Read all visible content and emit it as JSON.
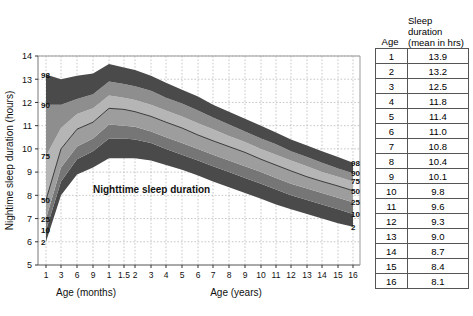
{
  "chart_data": {
    "type": "area",
    "title": "",
    "annotation": "Nighttime sleep duration",
    "ylabel": "Nightime sleep duration (hours)",
    "xlabel_left": "Age (months)",
    "xlabel_right": "Age (years)",
    "ylim": [
      5,
      14
    ],
    "yticks": [
      5,
      6,
      7,
      8,
      9,
      10,
      11,
      12,
      13,
      14
    ],
    "grid": true,
    "xtick_labels": [
      "1",
      "3",
      "6",
      "9",
      "1",
      "1.5",
      "2",
      "3",
      "4",
      "5",
      "6",
      "7",
      "8",
      "9",
      "10",
      "11",
      "12",
      "13",
      "14",
      "15",
      "16"
    ],
    "xtick_positions": [
      46,
      61,
      77,
      93,
      109,
      124,
      135,
      151,
      166,
      182,
      198,
      213,
      229,
      245,
      261,
      276,
      291,
      307,
      322,
      338,
      353
    ],
    "percentile_labels_left": [
      "98",
      "90",
      "75",
      "50",
      "25",
      "10",
      "2"
    ],
    "percentile_labels_right": [
      "98",
      "90",
      "75",
      "50",
      "25",
      "10",
      "2"
    ],
    "percentiles": [
      2,
      10,
      25,
      50,
      75,
      90,
      98
    ],
    "band_colors": {
      "p90_98": "#4a4a4a",
      "p75_90": "#8e8e8e",
      "p50_75": "#b5b5b5",
      "p25_50": "#9d9d9d",
      "p10_25": "#767676",
      "p2_10": "#4a4a4a",
      "median_line": "#2a2a2a"
    },
    "x_values": [
      1,
      3,
      6,
      9,
      12,
      18,
      24,
      36,
      48,
      60,
      72,
      84,
      96,
      108,
      120,
      132,
      144,
      156,
      168,
      180,
      192
    ],
    "series": [
      {
        "name": "2",
        "values": [
          6.0,
          8.0,
          8.9,
          9.2,
          9.6,
          9.6,
          9.6,
          9.5,
          9.3,
          9.1,
          8.85,
          8.6,
          8.35,
          8.1,
          7.85,
          7.6,
          7.4,
          7.2,
          7.0,
          6.8,
          6.65
        ]
      },
      {
        "name": "10",
        "values": [
          6.5,
          8.6,
          9.55,
          9.9,
          10.45,
          10.45,
          10.4,
          10.25,
          10.0,
          9.75,
          9.5,
          9.25,
          9.0,
          8.75,
          8.5,
          8.25,
          8.0,
          7.8,
          7.6,
          7.4,
          7.2
        ]
      },
      {
        "name": "25",
        "values": [
          7.0,
          9.2,
          10.1,
          10.45,
          11.05,
          11.0,
          10.95,
          10.75,
          10.5,
          10.25,
          10.0,
          9.75,
          9.5,
          9.25,
          9.0,
          8.75,
          8.5,
          8.3,
          8.1,
          7.9,
          7.7
        ]
      },
      {
        "name": "50",
        "values": [
          7.8,
          10.0,
          10.85,
          11.15,
          11.75,
          11.7,
          11.6,
          11.4,
          11.15,
          10.9,
          10.6,
          10.35,
          10.1,
          9.85,
          9.55,
          9.3,
          9.05,
          8.8,
          8.6,
          8.4,
          8.2
        ]
      },
      {
        "name": "75",
        "values": [
          9.7,
          10.9,
          11.5,
          11.75,
          12.3,
          12.2,
          12.1,
          11.9,
          11.65,
          11.4,
          11.1,
          10.85,
          10.55,
          10.3,
          10.0,
          9.75,
          9.5,
          9.25,
          9.0,
          8.8,
          8.6
        ]
      },
      {
        "name": "90",
        "values": [
          11.9,
          11.9,
          12.15,
          12.35,
          12.9,
          12.8,
          12.7,
          12.5,
          12.2,
          11.95,
          11.65,
          11.35,
          11.05,
          10.75,
          10.45,
          10.2,
          9.9,
          9.65,
          9.4,
          9.15,
          8.95
        ]
      },
      {
        "name": "98",
        "values": [
          13.2,
          13.0,
          13.15,
          13.25,
          13.65,
          13.5,
          13.4,
          13.15,
          12.85,
          12.55,
          12.25,
          11.9,
          11.6,
          11.3,
          11.0,
          10.7,
          10.4,
          10.15,
          9.9,
          9.65,
          9.4
        ]
      }
    ]
  },
  "table": {
    "header": {
      "age": "Age",
      "duration_line1": "Sleep",
      "duration_line2": "duration",
      "duration_line3": "(mean in hrs)"
    },
    "rows": [
      {
        "age": "1",
        "duration": "13.9"
      },
      {
        "age": "2",
        "duration": "13.2"
      },
      {
        "age": "3",
        "duration": "12.5"
      },
      {
        "age": "4",
        "duration": "11.8"
      },
      {
        "age": "5",
        "duration": "11.4"
      },
      {
        "age": "6",
        "duration": "11.0"
      },
      {
        "age": "7",
        "duration": "10.8"
      },
      {
        "age": "8",
        "duration": "10.4"
      },
      {
        "age": "9",
        "duration": "10.1"
      },
      {
        "age": "10",
        "duration": "9.8"
      },
      {
        "age": "11",
        "duration": "9.6"
      },
      {
        "age": "12",
        "duration": "9.3"
      },
      {
        "age": "13",
        "duration": "9.0"
      },
      {
        "age": "14",
        "duration": "8.7"
      },
      {
        "age": "15",
        "duration": "8.4"
      },
      {
        "age": "16",
        "duration": "8.1"
      }
    ]
  }
}
